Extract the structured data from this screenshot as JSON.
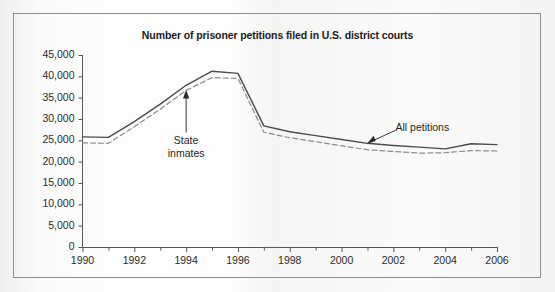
{
  "chart_data": {
    "type": "line",
    "title": "Number of prisoner petitions filed in U.S. district courts",
    "xlabel": "",
    "ylabel": "",
    "grid": false,
    "legend_position": "inline-annotations",
    "x": [
      1990,
      1991,
      1992,
      1993,
      1994,
      1995,
      1996,
      1997,
      1998,
      1999,
      2000,
      2001,
      2002,
      2003,
      2004,
      2005,
      2006
    ],
    "xlim": [
      1990,
      2006
    ],
    "ylim": [
      0,
      45000
    ],
    "xticks": [
      1990,
      1991,
      1992,
      1993,
      1994,
      1995,
      1996,
      1997,
      1998,
      1999,
      2000,
      2001,
      2002,
      2003,
      2004,
      2005,
      2006
    ],
    "xtick_labels": [
      "1990",
      "",
      "1992",
      "",
      "1994",
      "",
      "1996",
      "",
      "1998",
      "",
      "2000",
      "",
      "2002",
      "",
      "2004",
      "",
      "2006"
    ],
    "yticks": [
      0,
      5000,
      10000,
      15000,
      20000,
      25000,
      30000,
      35000,
      40000,
      45000
    ],
    "ytick_labels": [
      "0",
      "5,000",
      "10,000",
      "15,000",
      "20,000",
      "25,000",
      "30,000",
      "35,000",
      "40,000",
      "45,000"
    ],
    "series": [
      {
        "name": "All petitions",
        "style": "solid",
        "color": "#4a4a4a",
        "values": [
          25800,
          25700,
          29400,
          33500,
          37900,
          41200,
          40700,
          28400,
          27000,
          26100,
          25200,
          24300,
          23800,
          23400,
          23000,
          24200,
          24000
        ]
      },
      {
        "name": "State inmates",
        "style": "dashed",
        "color": "#8a8a8a",
        "values": [
          24400,
          24300,
          28200,
          32300,
          36700,
          39700,
          39500,
          26900,
          25600,
          24700,
          23700,
          22800,
          22400,
          22000,
          22100,
          22600,
          22500
        ]
      }
    ],
    "annotations": [
      {
        "name": "state-inmates",
        "text_line1": "State",
        "text_line2": "inmates",
        "points_to_year": 1994,
        "points_to_value": 36700,
        "arrow": "up"
      },
      {
        "name": "all-petitions",
        "text_line1": "All petitions",
        "text_line2": "",
        "points_to_year": 2001,
        "points_to_value": 24300,
        "arrow": "down-left"
      }
    ]
  },
  "figure": {
    "title": "Number of prisoner petitions filed in U.S. district courts",
    "ylabels": [
      "45,000",
      "40,000",
      "35,000",
      "30,000",
      "25,000",
      "20,000",
      "15,000",
      "10,000",
      "5,000",
      "0"
    ],
    "xlabels": [
      "1990",
      "1992",
      "1994",
      "1996",
      "1998",
      "2000",
      "2002",
      "2004",
      "2006"
    ],
    "annotation_state_line1": "State",
    "annotation_state_line2": "inmates",
    "annotation_all": "All petitions",
    "colors": {
      "axis": "#555555",
      "solid_series": "#4a4a4a",
      "dashed_series": "#8a8a8a",
      "frame": "#8d8d8d",
      "text": "#1e1e1e"
    }
  }
}
